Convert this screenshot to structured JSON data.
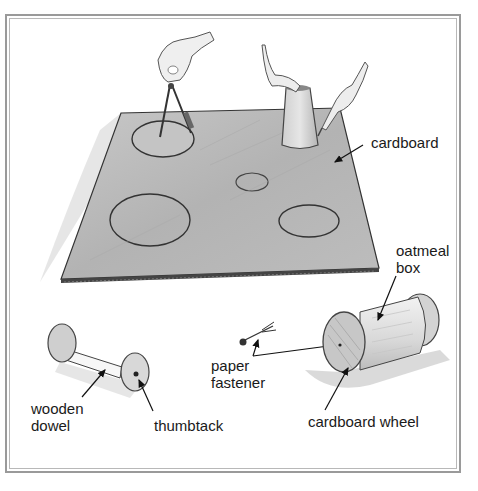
{
  "figure": {
    "colors": {
      "frame": "#9a9a9a",
      "cardboard": "#b9b9b9",
      "ink": "#2a2a2a",
      "text": "#1a1a1a"
    }
  },
  "labels": {
    "cardboard": "cardboard",
    "oatmeal_box_line1": "oatmeal",
    "oatmeal_box_line2": "box",
    "paper_fastener_line1": "paper",
    "paper_fastener_line2": "fastener",
    "wooden_dowel_line1": "wooden",
    "wooden_dowel_line2": "dowel",
    "thumbtack": "thumbtack",
    "cardboard_wheel": "cardboard wheel"
  },
  "scene": {
    "top": [
      "hand holding compass drawing circle",
      "hands tracing around an upside-down cup",
      "cardboard sheet with five drawn circles"
    ],
    "bottom": [
      "wooden dowel axle with two cardboard wheels held by thumbtacks",
      "paper fastener",
      "oatmeal box with cardboard wheels attached by paper fastener"
    ]
  }
}
